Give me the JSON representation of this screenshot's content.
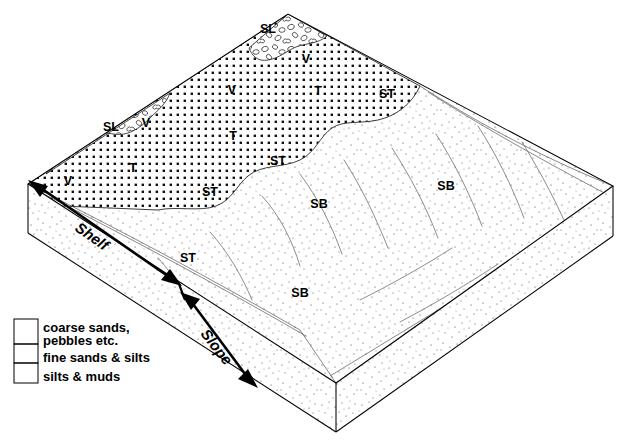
{
  "figure": {
    "type": "geological-block-diagram"
  },
  "axes": {
    "shelf_label": "Shelf",
    "slope_label": "Slope"
  },
  "facies_labels": [
    {
      "id": "sl-top",
      "text": "SL",
      "x": 268,
      "y": 33
    },
    {
      "id": "v-top",
      "text": "V",
      "x": 306,
      "y": 63
    },
    {
      "id": "t-upper",
      "text": "T",
      "x": 318,
      "y": 95
    },
    {
      "id": "st-upper",
      "text": "ST",
      "x": 387,
      "y": 98
    },
    {
      "id": "sl-left",
      "text": "SL",
      "x": 111,
      "y": 131
    },
    {
      "id": "v-left2",
      "text": "V",
      "x": 146,
      "y": 127
    },
    {
      "id": "v-mid",
      "text": "V",
      "x": 232,
      "y": 94
    },
    {
      "id": "t-mid",
      "text": "T",
      "x": 233,
      "y": 140
    },
    {
      "id": "st-mid",
      "text": "ST",
      "x": 278,
      "y": 165
    },
    {
      "id": "t-left",
      "text": "T",
      "x": 133,
      "y": 172
    },
    {
      "id": "v-lower",
      "text": "V",
      "x": 68,
      "y": 185
    },
    {
      "id": "st-notch",
      "text": "ST",
      "x": 210,
      "y": 196
    },
    {
      "id": "sb-upper",
      "text": "SB",
      "x": 319,
      "y": 208
    },
    {
      "id": "sb-right",
      "text": "SB",
      "x": 446,
      "y": 190
    },
    {
      "id": "st-slope",
      "text": "ST",
      "x": 188,
      "y": 262
    },
    {
      "id": "sb-lower",
      "text": "SB",
      "x": 300,
      "y": 297
    }
  ],
  "legend": {
    "items": [
      {
        "key": "coarse",
        "pattern": "pebbles-pattern",
        "label_line1": "coarse sands,",
        "label_line2": "pebbles  etc."
      },
      {
        "key": "fine",
        "pattern": "dense-dots-pattern",
        "label_line1": "fine sands  &  silts",
        "label_line2": ""
      },
      {
        "key": "silt",
        "pattern": "stipple-pattern",
        "label_line1": "silts  &  muds",
        "label_line2": ""
      }
    ]
  },
  "colors": {
    "ink": "#000000",
    "paper": "#ffffff",
    "hairline": "#555555",
    "flowline": "#777777"
  }
}
